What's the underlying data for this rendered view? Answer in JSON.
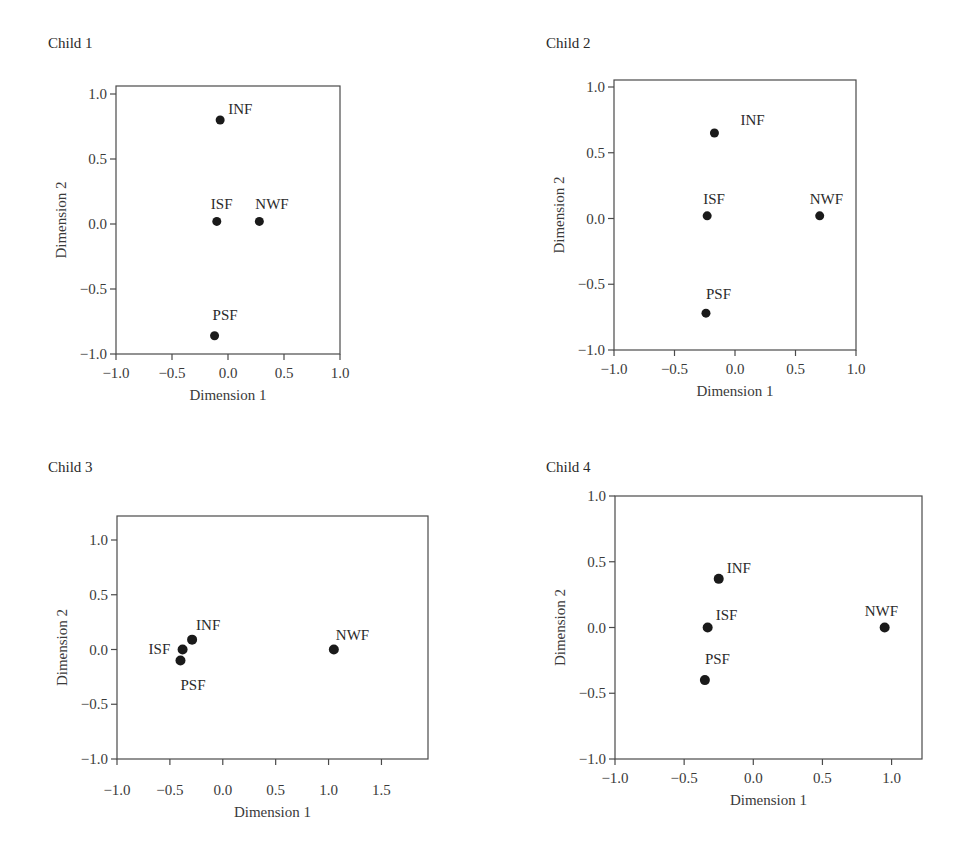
{
  "chart_data": [
    {
      "type": "scatter",
      "title": "Child 1",
      "xlabel": "Dimension 1",
      "ylabel": "Dimension 2",
      "xlim": [
        -1.0,
        1.0
      ],
      "ylim": [
        -1.0,
        1.0
      ],
      "xticks": [
        "-1.0",
        "-0.5",
        "0.0",
        "0.5",
        "1.0"
      ],
      "yticks": [
        "-1.0",
        "-0.5",
        "0.0",
        "0.5",
        "1.0"
      ],
      "grid": false,
      "points": [
        {
          "label": "INF",
          "x": -0.07,
          "y": 0.8
        },
        {
          "label": "ISF",
          "x": -0.1,
          "y": 0.02
        },
        {
          "label": "NWF",
          "x": 0.28,
          "y": 0.02
        },
        {
          "label": "PSF",
          "x": -0.12,
          "y": -0.86
        }
      ]
    },
    {
      "type": "scatter",
      "title": "Child 2",
      "xlabel": "Dimension 1",
      "ylabel": "Dimension 2",
      "xlim": [
        -1.0,
        1.0
      ],
      "ylim": [
        -1.0,
        1.0
      ],
      "xticks": [
        "-1.0",
        "-0.5",
        "0.0",
        "0.5",
        "1.0"
      ],
      "yticks": [
        "-1.0",
        "-0.5",
        "0.0",
        "0.5",
        "1.0"
      ],
      "grid": false,
      "points": [
        {
          "label": "INF",
          "x": -0.17,
          "y": 0.65
        },
        {
          "label": "ISF",
          "x": -0.23,
          "y": 0.02
        },
        {
          "label": "NWF",
          "x": 0.7,
          "y": 0.02
        },
        {
          "label": "PSF",
          "x": -0.24,
          "y": -0.72
        }
      ]
    },
    {
      "type": "scatter",
      "title": "Child 3",
      "xlabel": "Dimension 1",
      "ylabel": "Dimension 2",
      "xlim": [
        -1.0,
        1.94
      ],
      "ylim": [
        -1.0,
        1.22
      ],
      "xticks": [
        "-1.0",
        "-0.5",
        "0.0",
        "0.5",
        "1.0",
        "1.5"
      ],
      "yticks": [
        "-1.0",
        "-0.5",
        "0.0",
        "0.5",
        "1.0"
      ],
      "grid": false,
      "points": [
        {
          "label": "INF",
          "x": -0.29,
          "y": 0.09
        },
        {
          "label": "ISF",
          "x": -0.38,
          "y": 0.0
        },
        {
          "label": "NWF",
          "x": 1.05,
          "y": 0.0
        },
        {
          "label": "PSF",
          "x": -0.4,
          "y": -0.1
        }
      ]
    },
    {
      "type": "scatter",
      "title": "Child 4",
      "xlabel": "Dimension 1",
      "ylabel": "Dimension 2",
      "xlim": [
        -1.0,
        1.22
      ],
      "ylim": [
        -1.0,
        1.0
      ],
      "xticks": [
        "-1.0",
        "-0.5",
        "0.0",
        "0.5",
        "1.0"
      ],
      "yticks": [
        "-1.0",
        "-0.5",
        "0.0",
        "0.5",
        "1.0"
      ],
      "grid": false,
      "points": [
        {
          "label": "INF",
          "x": -0.25,
          "y": 0.37
        },
        {
          "label": "ISF",
          "x": -0.33,
          "y": 0.0
        },
        {
          "label": "NWF",
          "x": 0.95,
          "y": 0.0
        },
        {
          "label": "PSF",
          "x": -0.35,
          "y": -0.4
        }
      ]
    }
  ]
}
